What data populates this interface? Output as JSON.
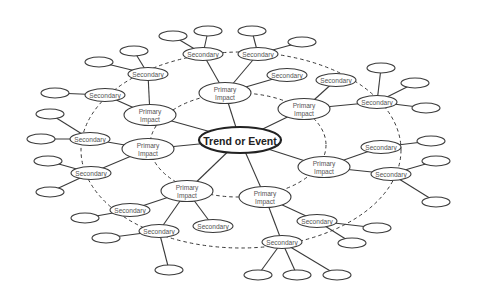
{
  "diagram": {
    "title": "Trend or Event",
    "labels": {
      "center": "Trend or Event",
      "primary_line1": "Primary",
      "primary_line2": "Impact",
      "secondary": "Secondary"
    },
    "colors": {
      "line": "#3a3a3a",
      "text": "#555555",
      "center_text": "#222222",
      "background": "#ffffff"
    },
    "rings": [
      {
        "name": "inner-ring",
        "cx": 238,
        "cy": 145,
        "rx": 88,
        "ry": 52
      },
      {
        "name": "outer-ring",
        "cx": 241,
        "cy": 150,
        "rx": 160,
        "ry": 98
      }
    ],
    "center": {
      "label": "Trend or Event",
      "cx": 240,
      "cy": 140,
      "rx": 41,
      "ry": 13
    },
    "primary": [
      {
        "id": "p1",
        "label1": "Primary",
        "label2": "Impact",
        "cx": 225,
        "cy": 93
      },
      {
        "id": "p2",
        "label1": "Primary",
        "label2": "Impact",
        "cx": 304,
        "cy": 109
      },
      {
        "id": "p3",
        "label1": "Primary",
        "label2": "Impact",
        "cx": 324,
        "cy": 167
      },
      {
        "id": "p4",
        "label1": "Primary",
        "label2": "Impact",
        "cx": 265,
        "cy": 197
      },
      {
        "id": "p5",
        "label1": "Primary",
        "label2": "Impact",
        "cx": 187,
        "cy": 191
      },
      {
        "id": "p6",
        "label1": "Primary",
        "label2": "Impact",
        "cx": 148,
        "cy": 149
      },
      {
        "id": "p7",
        "label1": "Primary",
        "label2": "Impact",
        "cx": 150,
        "cy": 115
      }
    ],
    "secondary": [
      {
        "id": "s1",
        "label": "Secondary",
        "cx": 203,
        "cy": 54,
        "parent": "p1"
      },
      {
        "id": "s2",
        "label": "Secondary",
        "cx": 258,
        "cy": 54,
        "parent": "p1"
      },
      {
        "id": "s3",
        "label": "Secondary",
        "cx": 287,
        "cy": 75,
        "parent": "p1"
      },
      {
        "id": "s4",
        "label": "Secondary",
        "cx": 336,
        "cy": 80,
        "parent": "p2"
      },
      {
        "id": "s5",
        "label": "Secondary",
        "cx": 377,
        "cy": 102,
        "parent": "p2"
      },
      {
        "id": "s6",
        "label": "Secondary",
        "cx": 381,
        "cy": 147,
        "parent": "p3"
      },
      {
        "id": "s7",
        "label": "Secondary",
        "cx": 391,
        "cy": 174,
        "parent": "p3"
      },
      {
        "id": "s8",
        "label": "Secondary",
        "cx": 317,
        "cy": 221,
        "parent": "p4"
      },
      {
        "id": "s9",
        "label": "Secondary",
        "cx": 282,
        "cy": 242,
        "parent": "p4"
      },
      {
        "id": "s10",
        "label": "Secondary",
        "cx": 213,
        "cy": 226,
        "parent": "p5"
      },
      {
        "id": "s11",
        "label": "Secondary",
        "cx": 159,
        "cy": 231,
        "parent": "p5"
      },
      {
        "id": "s12",
        "label": "Secondary",
        "cx": 130,
        "cy": 210,
        "parent": "p5"
      },
      {
        "id": "s13",
        "label": "Secondary",
        "cx": 91,
        "cy": 173,
        "parent": "p6"
      },
      {
        "id": "s14",
        "label": "Secondary",
        "cx": 90,
        "cy": 139,
        "parent": "p6"
      },
      {
        "id": "s15",
        "label": "Secondary",
        "cx": 105,
        "cy": 95,
        "parent": "p7"
      },
      {
        "id": "s16",
        "label": "Secondary",
        "cx": 148,
        "cy": 74,
        "parent": "p7"
      }
    ],
    "tertiary": [
      {
        "cx": 173,
        "cy": 36,
        "parent": "s1"
      },
      {
        "cx": 208,
        "cy": 31,
        "parent": "s1"
      },
      {
        "cx": 252,
        "cy": 31,
        "parent": "s2"
      },
      {
        "cx": 302,
        "cy": 42,
        "parent": "s2"
      },
      {
        "cx": 381,
        "cy": 68,
        "parent": "s5"
      },
      {
        "cx": 415,
        "cy": 83,
        "parent": "s5"
      },
      {
        "cx": 426,
        "cy": 108,
        "parent": "s5"
      },
      {
        "cx": 431,
        "cy": 141,
        "parent": "s6"
      },
      {
        "cx": 436,
        "cy": 161,
        "parent": "s7"
      },
      {
        "cx": 436,
        "cy": 202,
        "parent": "s7"
      },
      {
        "cx": 377,
        "cy": 228,
        "parent": "s8"
      },
      {
        "cx": 352,
        "cy": 243,
        "parent": "s8"
      },
      {
        "cx": 258,
        "cy": 275,
        "parent": "s9"
      },
      {
        "cx": 297,
        "cy": 275,
        "parent": "s9"
      },
      {
        "cx": 337,
        "cy": 275,
        "parent": "s9"
      },
      {
        "cx": 169,
        "cy": 270,
        "parent": "s11"
      },
      {
        "cx": 106,
        "cy": 238,
        "parent": "s11"
      },
      {
        "cx": 85,
        "cy": 218,
        "parent": "s12"
      },
      {
        "cx": 50,
        "cy": 192,
        "parent": "s13"
      },
      {
        "cx": 48,
        "cy": 161,
        "parent": "s13"
      },
      {
        "cx": 41,
        "cy": 139,
        "parent": "s14"
      },
      {
        "cx": 50,
        "cy": 114,
        "parent": "s14"
      },
      {
        "cx": 55,
        "cy": 93,
        "parent": "s15"
      },
      {
        "cx": 99,
        "cy": 62,
        "parent": "s16"
      },
      {
        "cx": 134,
        "cy": 51,
        "parent": "s16"
      }
    ]
  }
}
